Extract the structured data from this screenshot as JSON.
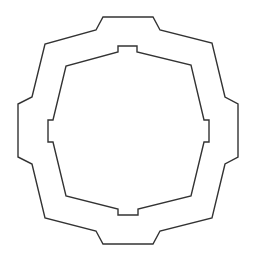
{
  "diagram": {
    "type": "nested-octagonal-frame",
    "width": 254,
    "height": 263,
    "stroke_color": "#333333",
    "background": "#ffffff",
    "stroke_width": 1.4,
    "outer_shape": {
      "name": "outer-octagon",
      "points": "103,17 153,17 160,30 212,43 225,97 238,104 238,157 225,164 212,218 160,231 153,244 103,244 96,231 45,218 32,164 18,157 18,104 32,97 45,44 96,30"
    },
    "inner_shape": {
      "name": "inner-notched-octagon",
      "points": "118,52 118,46 137,46 137,52 191,65 204,120 209,120 209,142 204,142 191,196 138,209 138,215 118,215 118,209 66,196 53,142 48,142 48,120 53,120 66,66"
    }
  }
}
